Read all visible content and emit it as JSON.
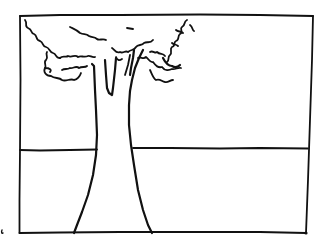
{
  "image": {
    "description": "Hand-drawn line sketch of a tree with a leafy crown and trunk inside a rectangular frame, crossed by a horizon line",
    "width": 330,
    "height": 249,
    "background_color": "#ffffff",
    "ink_color": "#111111"
  },
  "elements": {
    "frame": {
      "label": "Rectangular frame border"
    },
    "horizon": {
      "label": "Horizon line"
    },
    "tree_crown": {
      "label": "Scalloped leafy tree crown"
    },
    "tree_trunk": {
      "label": "Tree trunk with branches"
    },
    "margin_mark": {
      "label": "Small margin mark"
    }
  }
}
